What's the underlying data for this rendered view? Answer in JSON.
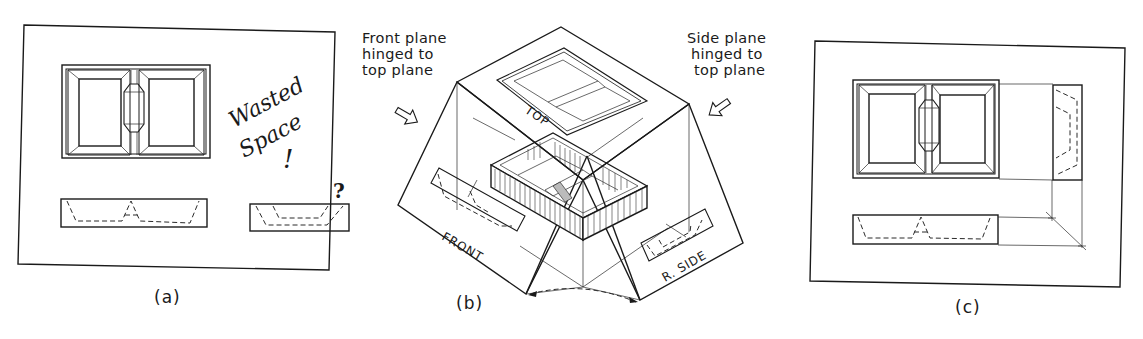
{
  "figure": {
    "panels": [
      {
        "id": "a",
        "caption": "(a)",
        "annotations": {
          "wasted_line1": "Wasted",
          "wasted_line2": "Space",
          "exclaim": "!",
          "question": "?"
        }
      },
      {
        "id": "b",
        "caption": "(b)",
        "front_note": [
          "Front plane",
          "hinged to",
          "top plane"
        ],
        "side_note": [
          "Side plane",
          "hinged to",
          "top plane"
        ],
        "plane_labels": {
          "top": "TOP",
          "front": "FRONT",
          "side": "R. SIDE"
        }
      },
      {
        "id": "c",
        "caption": "(c)"
      }
    ],
    "colors": {
      "ink": "#1a1a1a",
      "paper": "#ffffff"
    }
  }
}
